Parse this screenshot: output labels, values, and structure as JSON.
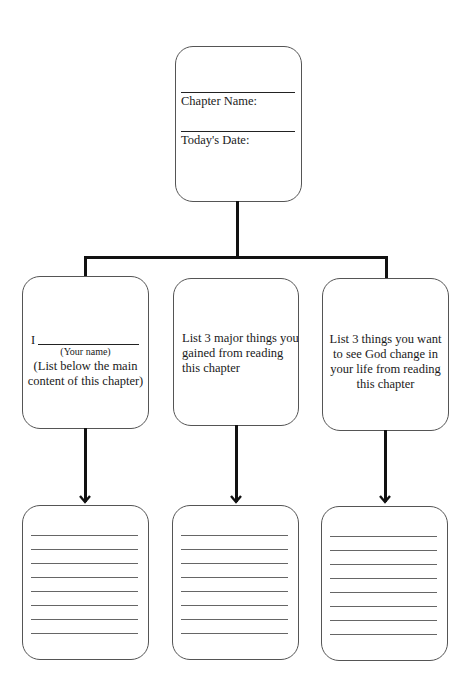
{
  "header_box": {
    "chapter_name_label": "Chapter Name:",
    "todays_date_label": "Today's Date:"
  },
  "boxes": [
    {
      "name_prefix": "I",
      "name_caption": "(Your name)",
      "lines": [
        "(List below the main",
        "content of this chapter)"
      ]
    },
    {
      "lines": [
        "List 3 major things you",
        "gained from reading",
        "this chapter"
      ]
    },
    {
      "lines": [
        "List 3 things you want",
        "to see God change in",
        "your life from reading",
        "this chapter"
      ]
    }
  ],
  "writing_boxes": {
    "line_count": 8
  }
}
